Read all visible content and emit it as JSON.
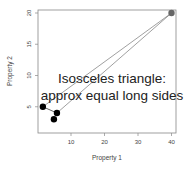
{
  "chart_data": {
    "type": "scatter",
    "title": "",
    "xlabel": "Property 1",
    "ylabel": "Property 2",
    "xlim": [
      0,
      41
    ],
    "ylim": [
      2,
      20.5
    ],
    "x_ticks": [
      10,
      20,
      30,
      40
    ],
    "y_ticks": [
      5,
      10,
      15,
      20
    ],
    "grid": false,
    "legend": null,
    "points": [
      {
        "x": 40,
        "y": 20,
        "color": "#666666"
      },
      {
        "x": 1.6,
        "y": 5,
        "color": "#000000"
      },
      {
        "x": 5.8,
        "y": 4,
        "color": "#000000"
      },
      {
        "x": 4.9,
        "y": 3,
        "color": "#000000"
      }
    ],
    "segments": [
      {
        "from": [
          1.6,
          5
        ],
        "to": [
          5.8,
          4
        ],
        "color": "#222222"
      },
      {
        "from": [
          1.6,
          5
        ],
        "to": [
          40,
          20
        ],
        "color": "#777777"
      },
      {
        "from": [
          5.8,
          4
        ],
        "to": [
          40,
          20
        ],
        "color": "#777777"
      }
    ],
    "annotation": {
      "line1": "Isosceles triangle:",
      "line2": "approx equal long sides"
    }
  }
}
